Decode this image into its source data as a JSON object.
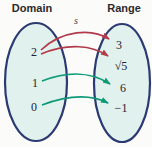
{
  "relation_label": "s",
  "domain": {
    "label": "Domain",
    "values": [
      "2",
      "1",
      "0"
    ]
  },
  "range": {
    "label": "Range",
    "values": [
      "3",
      "√5",
      "6",
      "−1"
    ]
  },
  "mappings": [
    {
      "from": "2",
      "to": "3",
      "color": "#b23b4b"
    },
    {
      "from": "2",
      "to": "√5",
      "color": "#b23b4b"
    },
    {
      "from": "1",
      "to": "6",
      "color": "#0e9a76"
    },
    {
      "from": "0",
      "to": "−1",
      "color": "#0e9a76"
    }
  ],
  "colors": {
    "arrow_red": "#b23b4b",
    "arrow_green": "#0e9a76",
    "ellipse_fill": "#e1f1ed",
    "ellipse_stroke": "#2b3a72",
    "title_text": "#2a2a2e",
    "node_text": "#232332",
    "relation_text": "#3c3c42",
    "background": "#fbfbfa"
  }
}
